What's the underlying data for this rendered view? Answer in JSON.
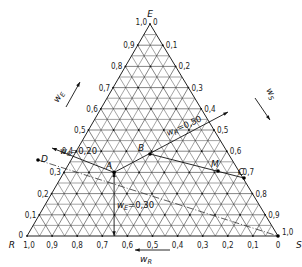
{
  "diagram": {
    "type": "ternary",
    "vertices": {
      "top": "E",
      "left": "R",
      "right": "S"
    },
    "axes": {
      "left_edge": {
        "label": "w_E",
        "label_main": "w",
        "label_sub": "E",
        "ticks": [
          "0",
          "0,1",
          "0,2",
          "0,3",
          "0,4",
          "0,5",
          "0,6",
          "0,7",
          "0,8",
          "0,9",
          "1,0"
        ]
      },
      "right_edge": {
        "label": "w_S",
        "label_main": "w",
        "label_sub": "S",
        "ticks": [
          "0",
          "0,1",
          "0,2",
          "0,3",
          "0,4",
          "0,5",
          "0,6",
          "0,7",
          "0,8",
          "0,9",
          "1,0"
        ]
      },
      "bottom_edge": {
        "label": "w_R",
        "label_main": "w",
        "label_sub": "R",
        "ticks": [
          "1,0",
          "0,9",
          "0,8",
          "0,7",
          "0,6",
          "0,5",
          "0,4",
          "0,3",
          "0,2",
          "0,1",
          "0"
        ]
      }
    },
    "points": [
      {
        "name": "A",
        "wE": 0.3,
        "wS": 0.2,
        "wR": 0.5
      },
      {
        "name": "B",
        "label": "B"
      },
      {
        "name": "M",
        "label": "M"
      },
      {
        "name": "C",
        "label": "C"
      },
      {
        "name": "D",
        "label": "D"
      }
    ],
    "annotations": {
      "ws": {
        "main": "w",
        "sub": "S",
        "value": "=0,20"
      },
      "wr": {
        "main": "w",
        "sub": "R",
        "value": "=0,50"
      },
      "we": {
        "main": "w",
        "sub": "E",
        "value": "=0,30"
      }
    },
    "labels": {
      "E": "E",
      "R": "R",
      "S": "S",
      "A": "A",
      "B": "B",
      "M": "M",
      "C": "C",
      "D": "D"
    }
  }
}
